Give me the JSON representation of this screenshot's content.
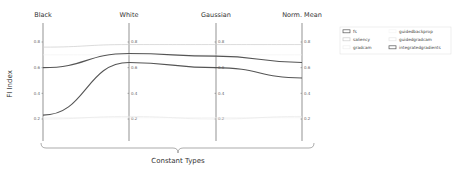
{
  "chart_data": {
    "type": "line",
    "subtype": "parallel-coordinates",
    "title": "",
    "xlabel": "Constant Types",
    "ylabel": "FI Index",
    "categories": [
      "Black",
      "White",
      "Gaussian",
      "Norm. Mean"
    ],
    "ylim": [
      0.1,
      0.9
    ],
    "yticks": [
      "0.2",
      "0.4",
      "0.6",
      "0.8"
    ],
    "grid": false,
    "legend_position": "upper right",
    "series": [
      {
        "name": "fs",
        "color": "#555555",
        "width": 1.1,
        "values": [
          0.6,
          0.71,
          0.69,
          0.64
        ]
      },
      {
        "name": "saliency",
        "color": "#cccccc",
        "width": 0.7,
        "values": [
          0.76,
          0.78,
          0.78,
          0.78
        ]
      },
      {
        "name": "gradcam",
        "color": "#eeeeee",
        "width": 0.6,
        "values": [
          0.21,
          0.21,
          0.21,
          0.21
        ]
      },
      {
        "name": "guidedbackprop",
        "color": "#f2f2f2",
        "width": 0.6,
        "values": [
          0.7,
          0.7,
          0.7,
          0.7
        ]
      },
      {
        "name": "guidedgradcam",
        "color": "#e6e6e6",
        "width": 0.6,
        "values": [
          0.2,
          0.22,
          0.2,
          0.22
        ]
      },
      {
        "name": "integratedgradients",
        "color": "#555555",
        "width": 1.1,
        "values": [
          0.23,
          0.64,
          0.6,
          0.52
        ]
      }
    ]
  },
  "legend": {
    "items": [
      {
        "label": "fs"
      },
      {
        "label": "saliency"
      },
      {
        "label": "gradcam"
      },
      {
        "label": "guidedbackprop"
      },
      {
        "label": "guidedgradcam"
      },
      {
        "label": "integratedgradients"
      }
    ]
  }
}
